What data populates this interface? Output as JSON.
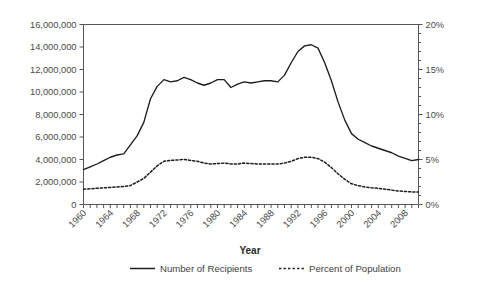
{
  "chart_data": {
    "type": "line",
    "title": "",
    "subtitle": "",
    "xlabel": "Year",
    "ylabel": "",
    "y2label": "",
    "grid": false,
    "legend_position": "bottom",
    "xlim": [
      1960,
      2010
    ],
    "ylim": [
      0,
      16000000
    ],
    "y2lim": [
      0,
      0.2
    ],
    "x_tick_step_major": 4,
    "x_tick_step_minor": 1,
    "x_tick_labels": [
      "1960",
      "1964",
      "1968",
      "1972",
      "1976",
      "1980",
      "1984",
      "1988",
      "1992",
      "1996",
      "2000",
      "2004",
      "2008"
    ],
    "y_tick_labels": [
      "0",
      "2,000,000",
      "4,000,000",
      "6,000,000",
      "8,000,000",
      "10,000,000",
      "12,000,000",
      "14,000,000",
      "16,000,000"
    ],
    "y_tick_values": [
      0,
      2000000,
      4000000,
      6000000,
      8000000,
      10000000,
      12000000,
      14000000,
      16000000
    ],
    "y2_tick_labels": [
      "0%",
      "5%",
      "10%",
      "15%",
      "20%"
    ],
    "y2_tick_values": [
      0,
      5,
      10,
      15,
      20
    ],
    "y2_minor_tick_step": 1,
    "x": [
      1960,
      1961,
      1962,
      1963,
      1964,
      1965,
      1966,
      1967,
      1968,
      1969,
      1970,
      1971,
      1972,
      1973,
      1974,
      1975,
      1976,
      1977,
      1978,
      1979,
      1980,
      1981,
      1982,
      1983,
      1984,
      1985,
      1986,
      1987,
      1988,
      1989,
      1990,
      1991,
      1992,
      1993,
      1994,
      1995,
      1996,
      1997,
      1998,
      1999,
      2000,
      2001,
      2002,
      2003,
      2004,
      2005,
      2006,
      2007,
      2008,
      2009,
      2010
    ],
    "series": [
      {
        "name": "Number of Recipients",
        "style": "solid",
        "axis": "left",
        "units": "recipients",
        "values": [
          3100000,
          3350000,
          3600000,
          3900000,
          4200000,
          4400000,
          4500000,
          5300000,
          6100000,
          7300000,
          9400000,
          10500000,
          11100000,
          10900000,
          11000000,
          11300000,
          11100000,
          10800000,
          10600000,
          10800000,
          11100000,
          11100000,
          10400000,
          10700000,
          10900000,
          10800000,
          10900000,
          11000000,
          11000000,
          10900000,
          11500000,
          12600000,
          13600000,
          14100000,
          14200000,
          13900000,
          12600000,
          11000000,
          9100000,
          7500000,
          6300000,
          5800000,
          5500000,
          5200000,
          5000000,
          4800000,
          4600000,
          4300000,
          4100000,
          3900000,
          4000000
        ]
      },
      {
        "name": "Percent of Population",
        "style": "dotted",
        "axis": "right",
        "units": "percent",
        "values": [
          1.7,
          1.75,
          1.8,
          1.85,
          1.9,
          1.95,
          2.0,
          2.1,
          2.5,
          2.9,
          3.6,
          4.3,
          4.8,
          4.9,
          4.95,
          5.0,
          4.9,
          4.8,
          4.6,
          4.5,
          4.55,
          4.6,
          4.5,
          4.5,
          4.6,
          4.55,
          4.5,
          4.5,
          4.5,
          4.5,
          4.6,
          4.8,
          5.1,
          5.25,
          5.25,
          5.1,
          4.7,
          4.1,
          3.4,
          2.8,
          2.3,
          2.1,
          1.95,
          1.85,
          1.8,
          1.7,
          1.6,
          1.5,
          1.45,
          1.4,
          1.4
        ]
      }
    ]
  },
  "legend": {
    "items": [
      {
        "label": "Number of Recipients",
        "style": "solid"
      },
      {
        "label": "Percent of Population",
        "style": "dotted"
      }
    ]
  },
  "axis": {
    "x_title": "Year"
  }
}
